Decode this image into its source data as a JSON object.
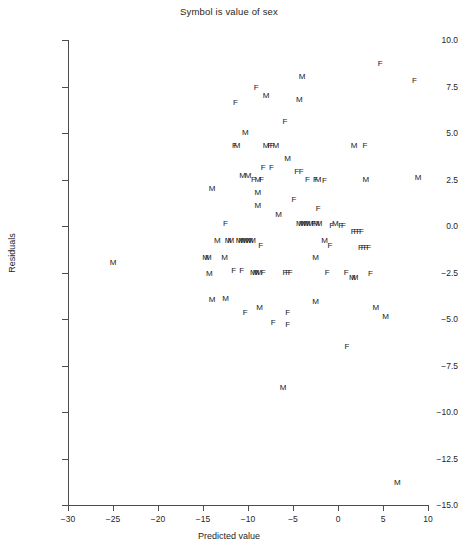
{
  "chart_data": {
    "type": "scatter",
    "title": "Symbol is value of sex",
    "xlabel": "Predicted value",
    "ylabel": "Residuals",
    "xlim": [
      -31,
      11
    ],
    "ylim": [
      -16,
      10.6
    ],
    "grid": false,
    "legend": "none",
    "symbol_note": "Each plotted marker is the letter M or F denoting the value of the variable sex",
    "xticks": [
      -30,
      -25,
      -20,
      -15,
      -10,
      -5,
      0,
      5,
      10
    ],
    "xticklabels": [
      "-30",
      "-25",
      "-20",
      "-15",
      "-10",
      "-5",
      "0",
      "5",
      "10"
    ],
    "yticks": [
      10.0,
      7.5,
      5.0,
      2.5,
      0.0,
      -2.5,
      -5.0,
      -7.5,
      -10.0,
      -12.5,
      -15.0
    ],
    "yticklabels": [
      "10.0",
      "7.5",
      "5.0",
      "2.5",
      "0.0",
      "-2.5",
      "-5.0",
      "-7.5",
      "-10.0",
      "-12.5",
      "-15.0"
    ],
    "series": [
      {
        "name": "M",
        "marker": "M",
        "points": [
          [
            -4.0,
            8.0
          ],
          [
            -8.0,
            7.0
          ],
          [
            -4.3,
            6.8
          ],
          [
            -10.3,
            5.0
          ],
          [
            -11.2,
            4.3
          ],
          [
            -8.0,
            4.3
          ],
          [
            -6.9,
            4.3
          ],
          [
            1.8,
            4.3
          ],
          [
            -5.6,
            3.6
          ],
          [
            -10.6,
            2.7
          ],
          [
            -10.0,
            2.7
          ],
          [
            -8.9,
            2.5
          ],
          [
            -2.2,
            2.5
          ],
          [
            3.1,
            2.5
          ],
          [
            8.9,
            2.6
          ],
          [
            -14.0,
            2.0
          ],
          [
            -8.9,
            1.8
          ],
          [
            -8.9,
            1.1
          ],
          [
            -6.6,
            0.6
          ],
          [
            -4.3,
            0.1
          ],
          [
            -4.0,
            0.1
          ],
          [
            -3.7,
            0.1
          ],
          [
            -3.4,
            0.1
          ],
          [
            -3.1,
            0.1
          ],
          [
            -2.4,
            0.1
          ],
          [
            -2.1,
            0.1
          ],
          [
            -0.3,
            0.1
          ],
          [
            -13.4,
            -0.8
          ],
          [
            -12.2,
            -0.8
          ],
          [
            -11.9,
            -0.8
          ],
          [
            -11.0,
            -0.8
          ],
          [
            -10.7,
            -0.8
          ],
          [
            -10.4,
            -0.8
          ],
          [
            -10.1,
            -0.8
          ],
          [
            -9.8,
            -0.8
          ],
          [
            -9.5,
            -0.8
          ],
          [
            -1.5,
            -0.8
          ],
          [
            -14.7,
            -1.7
          ],
          [
            -14.4,
            -1.7
          ],
          [
            -12.6,
            -1.7
          ],
          [
            -2.5,
            -1.7
          ],
          [
            -25.0,
            -2.0
          ],
          [
            -14.3,
            -2.6
          ],
          [
            -9.4,
            -2.5
          ],
          [
            -9.1,
            -2.5
          ],
          [
            -8.8,
            -2.5
          ],
          [
            1.6,
            -2.8
          ],
          [
            1.9,
            -2.8
          ],
          [
            -12.5,
            -3.9
          ],
          [
            -14.0,
            -4.0
          ],
          [
            -8.7,
            -4.4
          ],
          [
            -2.5,
            -4.1
          ],
          [
            4.2,
            -4.4
          ],
          [
            5.3,
            -4.9
          ],
          [
            -6.1,
            -8.7
          ],
          [
            6.6,
            -13.8
          ]
        ]
      },
      {
        "name": "F",
        "marker": "F",
        "points": [
          [
            4.7,
            8.7
          ],
          [
            8.5,
            7.8
          ],
          [
            -9.1,
            7.4
          ],
          [
            -11.4,
            6.6
          ],
          [
            -5.9,
            5.6
          ],
          [
            -11.5,
            4.3
          ],
          [
            -7.6,
            4.3
          ],
          [
            -7.3,
            4.3
          ],
          [
            3.0,
            4.3
          ],
          [
            -8.3,
            3.1
          ],
          [
            -7.4,
            3.1
          ],
          [
            -4.6,
            2.9
          ],
          [
            -4.1,
            2.9
          ],
          [
            -9.4,
            2.5
          ],
          [
            -8.5,
            2.5
          ],
          [
            -3.4,
            2.5
          ],
          [
            -2.5,
            2.5
          ],
          [
            -1.5,
            2.4
          ],
          [
            -4.9,
            1.4
          ],
          [
            -2.2,
            0.9
          ],
          [
            -12.5,
            0.1
          ],
          [
            -2.7,
            0.1
          ],
          [
            -0.7,
            0.0
          ],
          [
            0.3,
            0.0
          ],
          [
            0.6,
            0.0
          ],
          [
            1.7,
            -0.3
          ],
          [
            2.0,
            -0.3
          ],
          [
            2.3,
            -0.3
          ],
          [
            2.6,
            -0.3
          ],
          [
            -8.6,
            -1.1
          ],
          [
            -0.9,
            -1.1
          ],
          [
            2.5,
            -1.2
          ],
          [
            2.8,
            -1.2
          ],
          [
            3.1,
            -1.2
          ],
          [
            3.4,
            -1.2
          ],
          [
            -11.6,
            -2.4
          ],
          [
            -10.7,
            -2.4
          ],
          [
            -8.3,
            -2.5
          ],
          [
            -5.9,
            -2.5
          ],
          [
            -5.6,
            -2.5
          ],
          [
            -5.3,
            -2.5
          ],
          [
            -1.2,
            -2.5
          ],
          [
            0.9,
            -2.5
          ],
          [
            3.6,
            -2.6
          ],
          [
            -10.3,
            -4.7
          ],
          [
            -7.2,
            -5.2
          ],
          [
            -5.6,
            -4.7
          ],
          [
            -5.6,
            -5.3
          ],
          [
            1.0,
            -6.5
          ]
        ]
      }
    ]
  }
}
